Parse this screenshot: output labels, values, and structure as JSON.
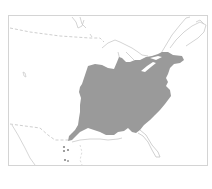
{
  "map": {
    "title": "",
    "region": "Eastern North America",
    "layers": {
      "range": {
        "label": "species range",
        "fill": "#9a9a9a"
      },
      "coastline": {
        "stroke": "#c9c9c9"
      },
      "borders": {
        "stroke": "#cfcfcf",
        "style": "dashed"
      },
      "frame": {
        "stroke": "#d4d4d4"
      }
    },
    "background": "#ffffff"
  }
}
